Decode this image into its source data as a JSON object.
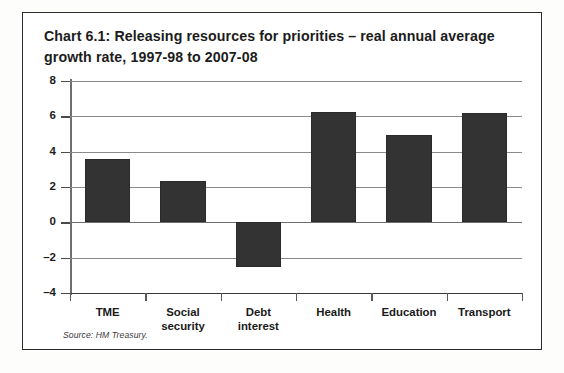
{
  "figure": {
    "title": "Chart 6.1: Releasing resources for priorities – real annual average growth rate, 1997-98 to 2007-08",
    "source_note": "Source: HM Treasury.",
    "border_color": "#2b2b2b",
    "bar_color": "#333333",
    "grid_color": "#8a8a8a",
    "text_color": "#1c1c1c"
  },
  "chart_data": {
    "type": "bar",
    "title": "Chart 6.1: Releasing resources for priorities – real annual average growth rate, 1997-98 to 2007-08",
    "categories": [
      "TME",
      "Social security",
      "Debt interest",
      "Health",
      "Education",
      "Transport"
    ],
    "values": [
      3.6,
      2.35,
      -2.55,
      6.25,
      4.95,
      6.2
    ],
    "xlabel": "",
    "ylabel": "",
    "ylim": [
      -4,
      8
    ],
    "yticks": [
      8,
      6,
      4,
      2,
      0,
      -2,
      -4
    ],
    "ytick_labels": [
      "8",
      "6",
      "4",
      "2",
      "0",
      "–2",
      "–4"
    ],
    "grid": true,
    "legend": false,
    "series": [
      {
        "name": "Real annual average growth rate",
        "values": [
          3.6,
          2.35,
          -2.55,
          6.25,
          4.95,
          6.2
        ]
      }
    ],
    "category_lines": [
      [
        "TME"
      ],
      [
        "Social",
        "security"
      ],
      [
        "Debt",
        "interest"
      ],
      [
        "Health"
      ],
      [
        "Education"
      ],
      [
        "Transport"
      ]
    ]
  }
}
